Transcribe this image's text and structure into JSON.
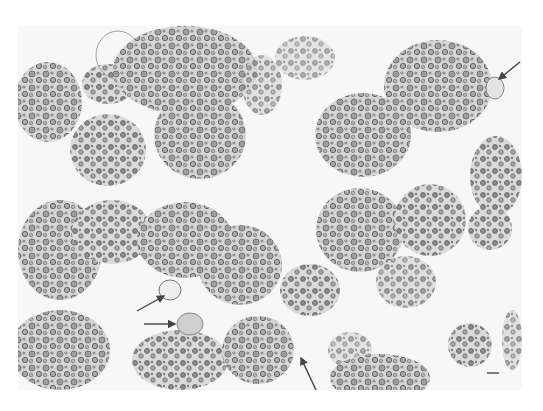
{
  "figure": {
    "type": "grayscale histology micrograph",
    "description": "Clusters of round cells with dark-rimmed granules on a pale background; arrows mark individual enlarged/pale cells",
    "background_color": "#ffffff",
    "tissue_bg_color": "#f7f7f7",
    "cell_fill_color": "#b8b8b8",
    "cell_dark_color": "#5a5a5a",
    "arrow_color": "#444444"
  },
  "annotations": {
    "arrows": [
      {
        "id": "arrow-top-right",
        "direction": "down-left",
        "x1": 520,
        "y1": 62,
        "x2": 499,
        "y2": 79
      },
      {
        "id": "arrow-left-upper",
        "direction": "up-right",
        "x1": 137,
        "y1": 311,
        "x2": 164,
        "y2": 296
      },
      {
        "id": "arrow-left-lower",
        "direction": "right",
        "x1": 144,
        "y1": 324,
        "x2": 175,
        "y2": 324
      },
      {
        "id": "arrow-bottom",
        "direction": "up-left",
        "x1": 316,
        "y1": 390,
        "x2": 301,
        "y2": 358
      }
    ],
    "scale_bar": {
      "x": 487,
      "y": 373,
      "length": 12,
      "label": ""
    }
  }
}
